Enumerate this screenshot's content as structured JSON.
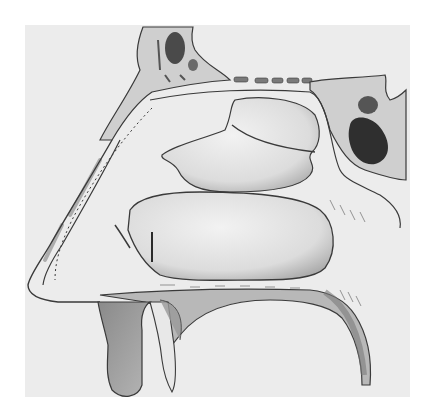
{
  "figure": {
    "background_color": "#ffffff",
    "paper_color": "#ececec",
    "ink_color": "#3a3a3a",
    "soft_tissue_color": "#e2e2e2",
    "bone_dark_color": "#4a4a4a",
    "shade_color": "#9a9a9a"
  }
}
